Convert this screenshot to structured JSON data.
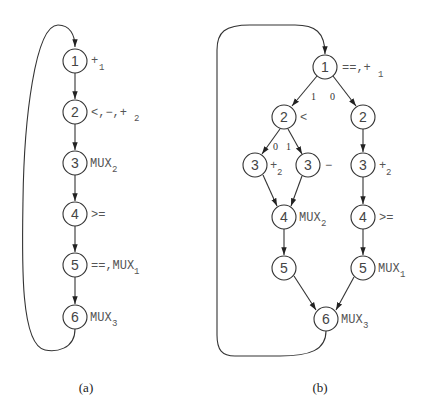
{
  "diagram_a": {
    "caption": "(a)",
    "nodes": [
      {
        "id": "1",
        "x": 75,
        "y": 61,
        "label": "+",
        "sub": "1"
      },
      {
        "id": "2",
        "x": 75,
        "y": 112,
        "label": "<,−,+",
        "sub": "2"
      },
      {
        "id": "3",
        "x": 75,
        "y": 163,
        "label": "MUX",
        "sub": "2"
      },
      {
        "id": "4",
        "x": 75,
        "y": 214,
        "label": ">=",
        "sub": ""
      },
      {
        "id": "5",
        "x": 75,
        "y": 265,
        "label": "==,MUX",
        "sub": "1"
      },
      {
        "id": "6",
        "x": 75,
        "y": 317,
        "label": "MUX",
        "sub": "3"
      }
    ]
  },
  "diagram_b": {
    "caption": "(b)",
    "nodes": [
      {
        "id": "1",
        "x": 325,
        "y": 67,
        "label": "==,+",
        "sub": "1"
      },
      {
        "id": "2",
        "x": 284,
        "y": 117,
        "label": "<",
        "sub": ""
      },
      {
        "id": "2",
        "x": 363,
        "y": 117,
        "label": "",
        "sub": ""
      },
      {
        "id": "3",
        "x": 255,
        "y": 165,
        "label": "+",
        "sub": "2"
      },
      {
        "id": "3",
        "x": 308,
        "y": 165,
        "label": "−",
        "sub": ""
      },
      {
        "id": "3",
        "x": 363,
        "y": 165,
        "label": "+",
        "sub": "2"
      },
      {
        "id": "4",
        "x": 284,
        "y": 217,
        "label": "MUX",
        "sub": "2"
      },
      {
        "id": "4",
        "x": 363,
        "y": 217,
        "label": ">=",
        "sub": ""
      },
      {
        "id": "5",
        "x": 284,
        "y": 268,
        "label": "",
        "sub": ""
      },
      {
        "id": "5",
        "x": 363,
        "y": 268,
        "label": "MUX",
        "sub": "1"
      },
      {
        "id": "6",
        "x": 326,
        "y": 319,
        "label": "MUX",
        "sub": "3"
      }
    ],
    "branch_labels": {
      "n1_left": "1",
      "n1_right": "0",
      "n2_left": "0",
      "n2_right": "1"
    }
  }
}
